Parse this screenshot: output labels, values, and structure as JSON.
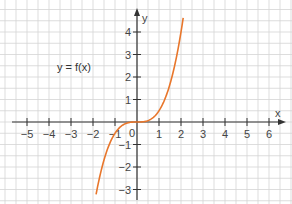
{
  "chart_data": {
    "type": "line",
    "title": "",
    "annotation": "y = f(x)",
    "xlabel": "x",
    "ylabel": "y",
    "xlim": [
      -6,
      7
    ],
    "ylim": [
      -3.5,
      5
    ],
    "grid": true,
    "x_ticks": [
      -5,
      -4,
      -3,
      -2,
      -1,
      1,
      2,
      3,
      4,
      5,
      6
    ],
    "y_ticks": [
      -3,
      -2,
      -1,
      1,
      2,
      3,
      4
    ],
    "origin_label": "0",
    "series": [
      {
        "name": "f(x)",
        "function": "0.5*x^3",
        "x": [
          -1.86,
          -1.5,
          -1.0,
          -0.5,
          0,
          0.5,
          1.0,
          1.5,
          2.0,
          2.1
        ],
        "values": [
          -3.22,
          -1.69,
          -0.5,
          -0.06,
          0,
          0.06,
          0.5,
          1.69,
          4.0,
          4.63
        ],
        "color": "#e8762b"
      }
    ]
  },
  "colors": {
    "grid": "#d4d4d4",
    "axis": "#333333",
    "curve": "#e8762b"
  }
}
